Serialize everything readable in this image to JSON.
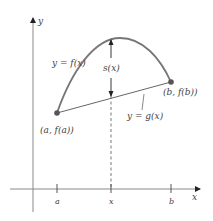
{
  "diagram": {
    "axes": {
      "x_label": "x",
      "y_label": "y"
    },
    "ticks": {
      "a": "a",
      "x": "x",
      "b": "b"
    },
    "labels": {
      "curve": "y = f(x)",
      "line": "y = g(x)",
      "distance": "s(x)",
      "point_a": "(a, f(a))",
      "point_b": "(b, f(b))"
    },
    "colors": {
      "curve": "#777777",
      "axis": "#888888",
      "point": "#555555",
      "text": "#444444"
    }
  }
}
